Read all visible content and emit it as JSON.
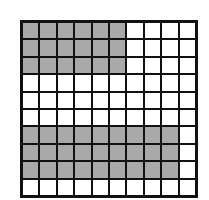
{
  "diagram": {
    "type": "grid",
    "columns": 10,
    "rows": 10,
    "shaded_color": "#a9a9a9",
    "unshaded_color": "#ffffff",
    "line_color": "#111111",
    "shaded_counts_per_row": [
      6,
      6,
      6,
      0,
      0,
      0,
      9,
      9,
      9,
      0
    ],
    "total_shaded": 45,
    "total_cells": 100
  }
}
